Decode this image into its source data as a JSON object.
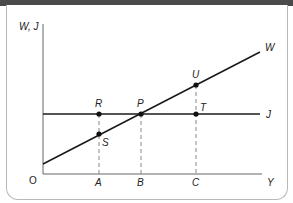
{
  "diagram": {
    "colors": {
      "header_bar": "#4a4a4a",
      "line": "#1a1a1a",
      "dashed": "#888888",
      "border": "#b8b8b8"
    },
    "axes": {
      "y_label": "W, J",
      "x_label": "Y",
      "origin_label": "O"
    },
    "curves": [
      {
        "name": "W",
        "label": "W",
        "type": "upward-sloping line"
      },
      {
        "name": "J",
        "label": "J",
        "type": "horizontal line"
      }
    ],
    "points": [
      {
        "label": "R",
        "on": "J",
        "x_tick": "A"
      },
      {
        "label": "S",
        "on": "W",
        "x_tick": "A"
      },
      {
        "label": "P",
        "on": "W and J intersection",
        "x_tick": "B"
      },
      {
        "label": "U",
        "on": "W",
        "x_tick": "C"
      },
      {
        "label": "T",
        "on": "J",
        "x_tick": "C"
      }
    ],
    "x_ticks": [
      "A",
      "B",
      "C"
    ],
    "labels": {
      "R": "R",
      "S": "S",
      "P": "P",
      "U": "U",
      "T": "T",
      "A": "A",
      "B": "B",
      "C": "C"
    }
  }
}
